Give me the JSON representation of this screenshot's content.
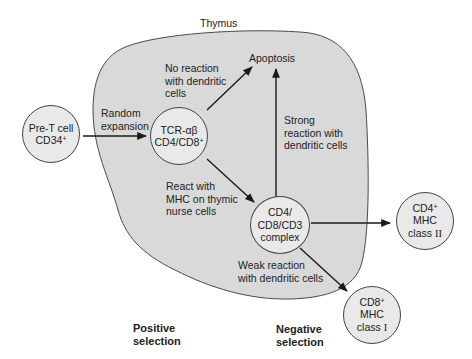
{
  "diagram": {
    "region_label": "Thymus",
    "colors": {
      "thymus_fill": "#d9d9d9",
      "cell_fill": "#e9e9e9",
      "stroke": "#3a3a3a",
      "background": "#ffffff"
    },
    "nodes": {
      "pre_t": {
        "line1": "Pre-T cell",
        "line2_base": "CD34",
        "line2_sup": "+"
      },
      "tcr": {
        "line1": "TCR-αβ",
        "line2_base": "CD4/CD8",
        "line2_sup": "+"
      },
      "apoptosis": {
        "label": "Apoptosis"
      },
      "complex": {
        "line1": "CD4/",
        "line2": "CD8/CD3",
        "line3": "complex"
      },
      "cd4": {
        "line1_base": "CD4",
        "line1_sup": "+",
        "line2": "MHC",
        "line3_base": "class ",
        "line3_roman": "II"
      },
      "cd8": {
        "line1_base": "CD8",
        "line1_sup": "+",
        "line2": "MHC",
        "line3_base": "class ",
        "line3_roman": "I"
      }
    },
    "edge_labels": {
      "random_expansion": "Random\nexpansion",
      "no_reaction": "No reaction\nwith dendritic\ncells",
      "strong_reaction": "Strong\nreaction with\ndendritic cells",
      "react_mhc": "React with\nMHC on thymic\nnurse cells",
      "weak_reaction": "Weak reaction\nwith dendritic cells"
    },
    "section_labels": {
      "positive": "Positive\nselection",
      "negative": "Negative\nselection"
    }
  }
}
